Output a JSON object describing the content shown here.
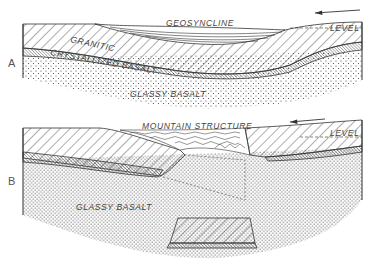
{
  "figure": {
    "panels": [
      {
        "id": "A",
        "letter": "A",
        "labels": {
          "geosyncline": "GEOSYNCLINE",
          "granitic": "GRANITIC",
          "crystallized_basalt": "CRYSTALLIZED BASALT",
          "glassy_basalt": "GLASSY BASALT",
          "level": "LEVEL"
        },
        "arrow_direction": "left"
      },
      {
        "id": "B",
        "letter": "B",
        "labels": {
          "mountain_structure": "MOUNTAIN STRUCTURE",
          "glassy_basalt": "GLASSY BASALT",
          "level": "LEVEL"
        },
        "arrow_direction": "left"
      }
    ],
    "colors": {
      "ink": "#333333",
      "background": "#ffffff"
    }
  }
}
